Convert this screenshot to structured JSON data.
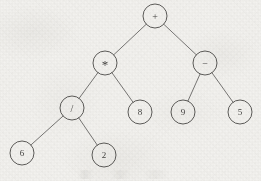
{
  "figure": {
    "kind": "binary-expression-tree",
    "title": "",
    "colors": {
      "paper": "#f3f2ef",
      "ink": "#3e3d3b",
      "edge": "#4b4a48",
      "label": "#2f2e2c"
    },
    "canvas": {
      "width": 261,
      "height": 181
    }
  },
  "diagram_data": {
    "type": "tree",
    "node_radius": 12,
    "nodes": [
      {
        "id": "n1",
        "label": "+",
        "kind": "operator",
        "icon": "plus-icon",
        "x": 155,
        "y": 16,
        "depth": 0
      },
      {
        "id": "n2",
        "label": "*",
        "kind": "operator",
        "icon": "asterisk-icon",
        "x": 105,
        "y": 63,
        "depth": 1
      },
      {
        "id": "n3",
        "label": "−",
        "kind": "operator",
        "icon": "minus-icon",
        "x": 205,
        "y": 63,
        "depth": 1
      },
      {
        "id": "n4",
        "label": "/",
        "kind": "operator",
        "icon": "slash-icon",
        "x": 72,
        "y": 108,
        "depth": 2
      },
      {
        "id": "n5",
        "label": "8",
        "kind": "operand",
        "icon": "",
        "x": 140,
        "y": 112,
        "depth": 2
      },
      {
        "id": "n6",
        "label": "9",
        "kind": "operand",
        "icon": "",
        "x": 183,
        "y": 112,
        "depth": 2
      },
      {
        "id": "n7",
        "label": "5",
        "kind": "operand",
        "icon": "",
        "x": 240,
        "y": 112,
        "depth": 2
      },
      {
        "id": "n8",
        "label": "6",
        "kind": "operand",
        "icon": "",
        "x": 22,
        "y": 153,
        "depth": 3
      },
      {
        "id": "n9",
        "label": "2",
        "kind": "operand",
        "icon": "",
        "x": 104,
        "y": 155,
        "depth": 3
      }
    ],
    "edges": [
      {
        "from": "n1",
        "to": "n2",
        "side": "left"
      },
      {
        "from": "n1",
        "to": "n3",
        "side": "right"
      },
      {
        "from": "n2",
        "to": "n4",
        "side": "left"
      },
      {
        "from": "n2",
        "to": "n5",
        "side": "right"
      },
      {
        "from": "n3",
        "to": "n6",
        "side": "left"
      },
      {
        "from": "n3",
        "to": "n7",
        "side": "right"
      },
      {
        "from": "n4",
        "to": "n8",
        "side": "left"
      },
      {
        "from": "n4",
        "to": "n9",
        "side": "right"
      }
    ]
  }
}
